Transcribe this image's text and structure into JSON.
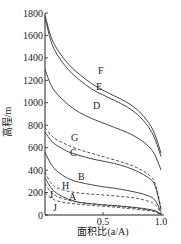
{
  "chart_data": {
    "type": "line",
    "title": "",
    "xlabel": "面积比(a/A)",
    "ylabel": "高程/m",
    "xlim": [
      0,
      1.0
    ],
    "ylim": [
      0,
      1800
    ],
    "x_ticks": [
      0.5,
      1.0
    ],
    "x_tick_labels": [
      "0.5",
      "1.0"
    ],
    "y_ticks": [
      0,
      200,
      400,
      600,
      800,
      1000,
      1200,
      1400,
      1600,
      1800
    ],
    "y_tick_labels": [
      "0",
      "200",
      "400",
      "600",
      "800",
      "1000",
      "1200",
      "1400",
      "1600",
      "1800"
    ],
    "grid": false,
    "legend": "inline labels on curves",
    "x": [
      0,
      0.05,
      0.1,
      0.2,
      0.3,
      0.4,
      0.5,
      0.6,
      0.7,
      0.8,
      0.9,
      0.95,
      1.0
    ],
    "series": [
      {
        "name": "F",
        "style": "solid",
        "values": [
          1780,
          1580,
          1480,
          1340,
          1250,
          1170,
          1110,
          1060,
          1010,
          940,
          820,
          720,
          550
        ]
      },
      {
        "name": "E",
        "style": "solid",
        "values": [
          1760,
          1540,
          1430,
          1290,
          1200,
          1120,
          1070,
          1020,
          970,
          900,
          780,
          680,
          520
        ]
      },
      {
        "name": "D",
        "style": "solid",
        "values": [
          1300,
          1150,
          1080,
          980,
          910,
          860,
          820,
          780,
          740,
          690,
          610,
          540,
          400
        ]
      },
      {
        "name": "G",
        "style": "dashed",
        "values": [
          780,
          710,
          670,
          620,
          580,
          550,
          520,
          490,
          460,
          420,
          360,
          300,
          60
        ]
      },
      {
        "name": "C",
        "style": "solid",
        "values": [
          740,
          660,
          620,
          560,
          530,
          500,
          480,
          460,
          430,
          390,
          330,
          280,
          50
        ]
      },
      {
        "name": "B",
        "style": "solid",
        "values": [
          560,
          450,
          390,
          320,
          290,
          270,
          250,
          240,
          220,
          200,
          170,
          140,
          30
        ]
      },
      {
        "name": "H",
        "style": "dashed",
        "values": [
          380,
          280,
          240,
          210,
          195,
          185,
          180,
          170,
          160,
          150,
          120,
          100,
          20
        ]
      },
      {
        "name": "A",
        "style": "solid",
        "values": [
          330,
          240,
          190,
          140,
          110,
          100,
          90,
          85,
          75,
          65,
          50,
          40,
          10
        ]
      },
      {
        "name": "I",
        "style": "dashed",
        "values": [
          280,
          200,
          165,
          130,
          110,
          100,
          90,
          80,
          70,
          60,
          45,
          35,
          5
        ]
      },
      {
        "name": "J",
        "style": "dashed",
        "values": [
          200,
          150,
          125,
          105,
          95,
          85,
          78,
          70,
          60,
          50,
          38,
          28,
          5
        ]
      }
    ]
  },
  "labels": {
    "F": "F",
    "E": "E",
    "D": "D",
    "G": "G",
    "C": "C",
    "B": "B",
    "H": "H",
    "A": "A",
    "I": "I",
    "J": "J"
  }
}
